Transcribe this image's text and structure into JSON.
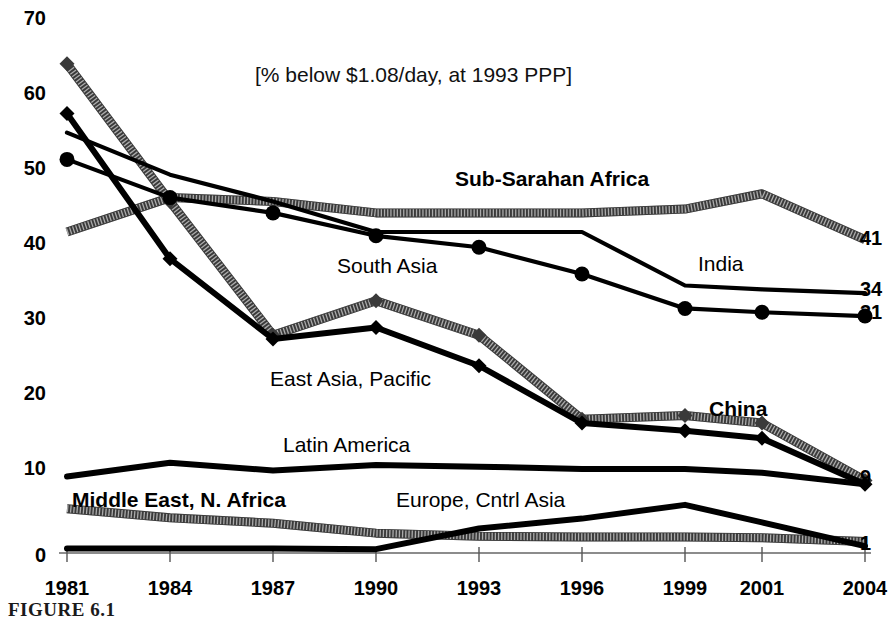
{
  "figure": {
    "caption": "FIGURE 6.1"
  },
  "chart_data": {
    "type": "line",
    "title": "[% below $1.08/day, at 1993 PPP]",
    "xlabel": "",
    "ylabel": "",
    "grid": false,
    "legend_position": "inline-annotations",
    "categories": [
      "1981",
      "1984",
      "1987",
      "1990",
      "1993",
      "1996",
      "1999",
      "2001",
      "2004"
    ],
    "x_tick_labels": [
      "1981",
      "1984",
      "1987",
      "1990",
      "1993",
      "1996",
      "1999",
      "2001",
      "2004"
    ],
    "y_tick_labels": [
      "0",
      "10",
      "20",
      "30",
      "40",
      "50",
      "60",
      "70"
    ],
    "y_ticks": [
      0,
      10,
      20,
      30,
      40,
      50,
      60,
      70
    ],
    "ylim": [
      0,
      70
    ],
    "series": [
      {
        "name": "Sub-Sarahan Africa",
        "label": "Sub-Sarahan Africa",
        "style": "hatched-thick",
        "marker": "none",
        "label_bold": true,
        "end_label": "41",
        "values": [
          42,
          46.5,
          46,
          44.5,
          44.5,
          44.5,
          45,
          47,
          41
        ]
      },
      {
        "name": "South Asia",
        "label": "South Asia",
        "style": "solid-thin",
        "marker": "none",
        "label_bold": false,
        "end_label": "34",
        "values": [
          55,
          49.5,
          46,
          42,
          42,
          42,
          35,
          34.5,
          34
        ]
      },
      {
        "name": "India",
        "label": "India",
        "style": "solid-thin",
        "marker": "circle",
        "label_bold": false,
        "end_label": "31",
        "values": [
          51.5,
          46.5,
          44.5,
          41.5,
          40,
          36.5,
          32,
          31.5,
          31
        ]
      },
      {
        "name": "East Asia, Pacific",
        "label": "East Asia, Pacific",
        "style": "hatched-thick",
        "marker": "diamond",
        "label_bold": false,
        "end_label": "",
        "values": [
          64,
          46,
          28.5,
          33,
          28.5,
          17.5,
          18,
          17,
          9.5
        ]
      },
      {
        "name": "China",
        "label": "China",
        "style": "solid-thick",
        "marker": "diamond",
        "label_bold": true,
        "end_label": "9",
        "values": [
          57.5,
          38.5,
          28,
          29.5,
          24.5,
          17,
          16,
          15,
          9
        ]
      },
      {
        "name": "Latin America",
        "label": "Latin America",
        "style": "solid-thick",
        "marker": "none",
        "label_bold": false,
        "end_label": "",
        "values": [
          10,
          11.8,
          10.8,
          11.5,
          11.3,
          11,
          11,
          10.5,
          9
        ]
      },
      {
        "name": "Middle East, N. Africa",
        "label": "Middle East, N. Africa",
        "style": "hatched-thick",
        "marker": "none",
        "label_bold": true,
        "end_label": "1",
        "values": [
          5.8,
          4.6,
          3.9,
          2.6,
          2.2,
          2.1,
          2.1,
          2.0,
          1.5
        ]
      },
      {
        "name": "Europe, Cntrl Asia",
        "label": "Europe, Cntrl Asia",
        "style": "solid-thick",
        "marker": "none",
        "label_bold": false,
        "end_label": "",
        "values": [
          0.6,
          0.6,
          0.6,
          0.5,
          3.2,
          4.5,
          6.3,
          4.0,
          0.9
        ]
      }
    ]
  }
}
